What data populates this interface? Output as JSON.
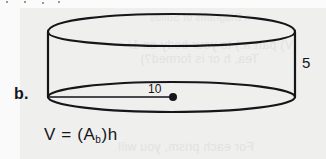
{
  "figure": {
    "part_label": "b.",
    "shape": "cylinder",
    "radius_label": "10",
    "height_label": "5",
    "center_dot": true
  },
  "formula": {
    "volume_symbol": "V",
    "equals": "=",
    "open_paren": "(",
    "base_area_symbol": "A",
    "base_subscript": "b",
    "close_paren": ")",
    "height_symbol": "h",
    "full_text": "V = (Ab)h"
  },
  "ghost_text": {
    "line1": "n Diagrams of Solids",
    "line2": "V) part a.) to your body on  1/",
    "line3": "Tea, h or is formed?)",
    "line4": "For each prism, you will"
  },
  "colors": {
    "paper": "#efefed",
    "ink": "#15151a",
    "ghost": "#e2e2e0"
  }
}
